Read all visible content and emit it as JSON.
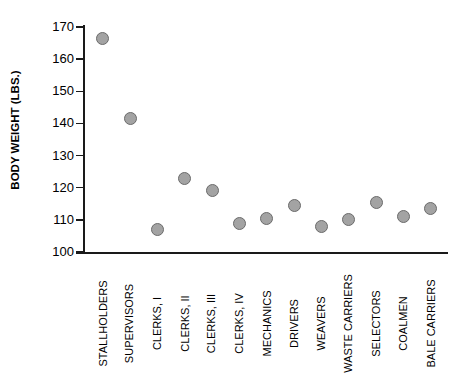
{
  "chart_data": {
    "type": "scatter",
    "title": "",
    "xlabel": "",
    "ylabel": "BODY WEIGHT (LBS.)",
    "ylim": [
      100,
      170
    ],
    "yticks": [
      100,
      110,
      120,
      130,
      140,
      150,
      160,
      170
    ],
    "ytick_labels": [
      "100",
      "110",
      "120",
      "130",
      "140",
      "150",
      "160",
      "170"
    ],
    "grid": false,
    "legend": false,
    "marker_color": "#a3a3a3",
    "marker_edge_color": "#6b6b6b",
    "categories": [
      "STALLHOLDERS",
      "SUPERVISORS",
      "CLERKS, I",
      "CLERKS, II",
      "CLERKS, III",
      "CLERKS, IV",
      "MECHANICS",
      "DRIVERS",
      "WEAVERS",
      "WASTE CARRIERS",
      "SELECTORS",
      "COALMEN",
      "BALE CARRIERS"
    ],
    "values": [
      166.5,
      141.5,
      107,
      123,
      119,
      109,
      110.5,
      114.5,
      108,
      110,
      115.5,
      111,
      113.5
    ]
  }
}
